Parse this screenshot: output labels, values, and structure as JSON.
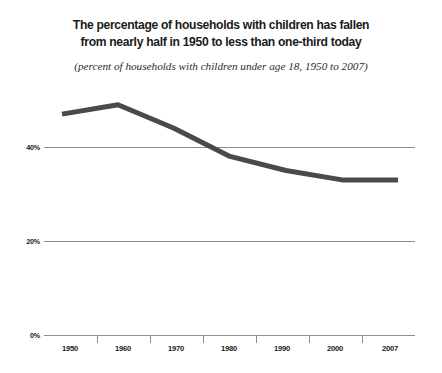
{
  "title": {
    "line1": "The percentage of households with children has fallen",
    "line2": "from nearly half in 1950 to less than one-third today"
  },
  "subtitle": "(percent of households with children under age 18, 1950 to 2007)",
  "chart_data": {
    "type": "line",
    "title": "The percentage of households with children has fallen from nearly half in 1950 to less than one-third today",
    "subtitle": "(percent of households with children under age 18, 1950 to 2007)",
    "xlabel": "",
    "ylabel": "",
    "categories": [
      "1950",
      "1960",
      "1970",
      "1980",
      "1990",
      "2000",
      "2007"
    ],
    "values": [
      47,
      49,
      44,
      38,
      35,
      33,
      33
    ],
    "ylim": [
      0,
      50
    ],
    "yticks": [
      0,
      20,
      40
    ],
    "ytick_labels": [
      "0%",
      "20%",
      "40%"
    ],
    "grid": true,
    "legend": "none",
    "series_color": "#4a4a4a",
    "gridline_color": "#8c8c8c",
    "line_width": 5
  },
  "axis": {
    "y_labels": [
      "40%",
      "20%",
      "0%"
    ],
    "x_labels": [
      "1950",
      "1960",
      "1970",
      "1980",
      "1990",
      "2000",
      "2007"
    ]
  }
}
